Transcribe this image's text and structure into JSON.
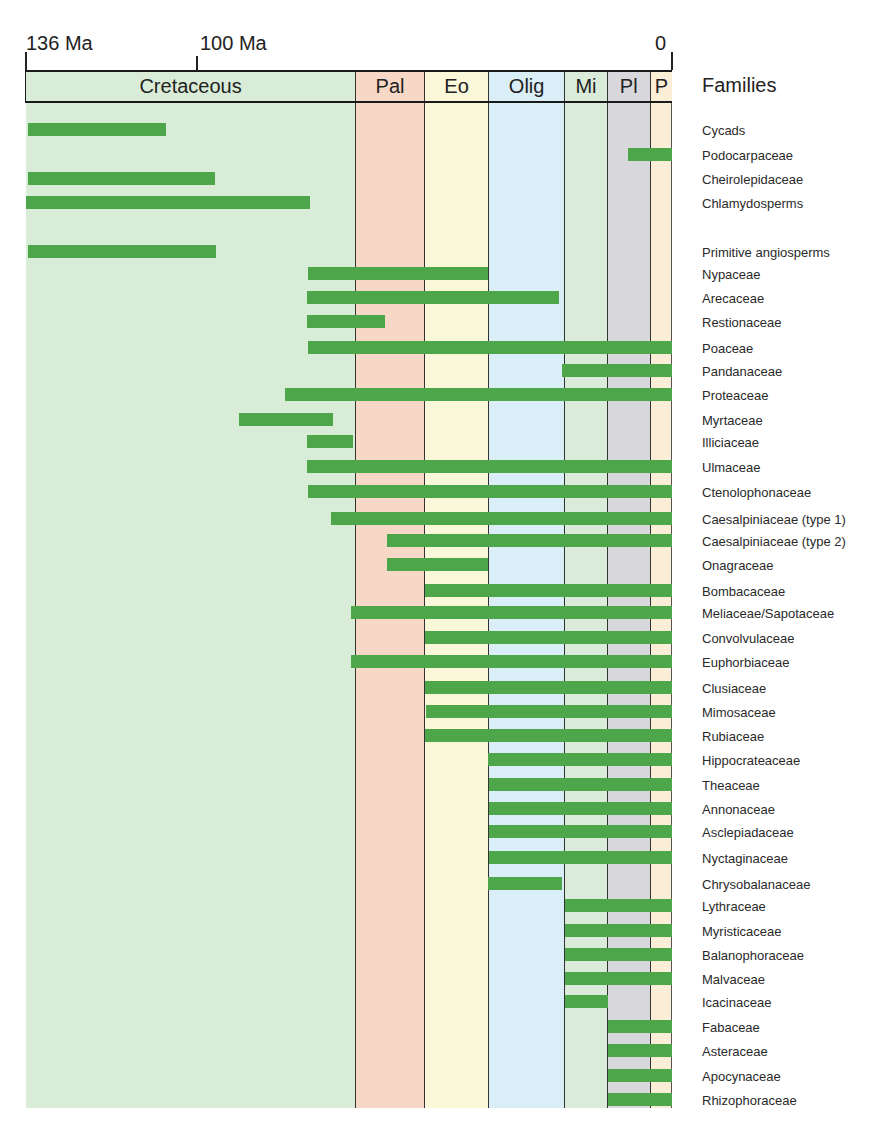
{
  "chart_data": {
    "type": "bar",
    "subtype": "horizontal range (time-range) bars",
    "title": "",
    "xlabel": "Time (Ma)",
    "ylabel": "Families",
    "x_axis": {
      "range_ma": [
        136,
        0
      ],
      "ticks": [
        {
          "label": "136 Ma",
          "value": 136
        },
        {
          "label": "100 Ma",
          "value": 100
        },
        {
          "label": "0",
          "value": 0
        }
      ]
    },
    "periods": [
      {
        "label": "Cretaceous",
        "start_ma": 136,
        "end_ma": 66.5,
        "color": "#d9ecd8"
      },
      {
        "label": "Pal",
        "start_ma": 66.5,
        "end_ma": 52,
        "color": "#f7d7c6"
      },
      {
        "label": "Eo",
        "start_ma": 52,
        "end_ma": 38.5,
        "color": "#fbf8da"
      },
      {
        "label": "Olig",
        "start_ma": 38.5,
        "end_ma": 22.5,
        "color": "#daeef7"
      },
      {
        "label": "Mi",
        "start_ma": 22.5,
        "end_ma": 13.5,
        "color": "#dbebd9"
      },
      {
        "label": "Pl",
        "start_ma": 13.5,
        "end_ma": 4.5,
        "color": "#d7d7dc"
      },
      {
        "label": "P",
        "start_ma": 4.5,
        "end_ma": 0,
        "color": "#fbeed6"
      }
    ],
    "legend_title": "Families",
    "bar_color": "#4ea64a",
    "series": [
      {
        "name": "Cycads",
        "start_ma": 135.6,
        "end_ma": 106.5
      },
      {
        "name": "Podocarpaceae",
        "start_ma": 9.3,
        "end_ma": 0
      },
      {
        "name": "Cheirolepidaceae",
        "start_ma": 135.6,
        "end_ma": 96.3
      },
      {
        "name": "Chlamydosperms",
        "start_ma": 136,
        "end_ma": 76.2
      },
      {
        "name": "Primitive angiosperms",
        "start_ma": 135.6,
        "end_ma": 96.1
      },
      {
        "name": "Nypaceae",
        "start_ma": 76.6,
        "end_ma": 38.7
      },
      {
        "name": "Arecaceae",
        "start_ma": 76.8,
        "end_ma": 23.7
      },
      {
        "name": "Restionaceae",
        "start_ma": 76.8,
        "end_ma": 60.4
      },
      {
        "name": "Poaceae",
        "start_ma": 76.6,
        "end_ma": 0
      },
      {
        "name": "Pandanaceae",
        "start_ma": 23.2,
        "end_ma": 0
      },
      {
        "name": "Proteaceae",
        "start_ma": 81.5,
        "end_ma": 0
      },
      {
        "name": "Myrtaceae",
        "start_ma": 91.2,
        "end_ma": 71.4
      },
      {
        "name": "Illiciaceae",
        "start_ma": 76.8,
        "end_ma": 67.2
      },
      {
        "name": "Ulmaceae",
        "start_ma": 76.8,
        "end_ma": 0
      },
      {
        "name": "Ctenolophonaceae",
        "start_ma": 76.6,
        "end_ma": 0
      },
      {
        "name": "Caesalpiniaceae (type 1)",
        "start_ma": 71.8,
        "end_ma": 0
      },
      {
        "name": "Caesalpiniaceae (type 2)",
        "start_ma": 60.0,
        "end_ma": 0
      },
      {
        "name": "Onagraceae",
        "start_ma": 60.0,
        "end_ma": 38.7
      },
      {
        "name": "Bombacaceae",
        "start_ma": 52.0,
        "end_ma": 0
      },
      {
        "name": "Meliaceae/Sapotaceae",
        "start_ma": 67.6,
        "end_ma": 0
      },
      {
        "name": "Convolvulaceae",
        "start_ma": 52.0,
        "end_ma": 0
      },
      {
        "name": "Euphorbiaceae",
        "start_ma": 67.6,
        "end_ma": 0
      },
      {
        "name": "Clusiaceae",
        "start_ma": 52.0,
        "end_ma": 0
      },
      {
        "name": "Mimosaceae",
        "start_ma": 51.8,
        "end_ma": 0
      },
      {
        "name": "Rubiaceae",
        "start_ma": 52.0,
        "end_ma": 0
      },
      {
        "name": "Hippocrateaceae",
        "start_ma": 38.7,
        "end_ma": 0
      },
      {
        "name": "Theaceae",
        "start_ma": 38.5,
        "end_ma": 0
      },
      {
        "name": "Annonaceae",
        "start_ma": 38.5,
        "end_ma": 0
      },
      {
        "name": "Asclepiadaceae",
        "start_ma": 38.5,
        "end_ma": 0
      },
      {
        "name": "Nyctaginaceae",
        "start_ma": 38.5,
        "end_ma": 0
      },
      {
        "name": "Chrysobalanaceae",
        "start_ma": 38.7,
        "end_ma": 23.2
      },
      {
        "name": "Lythraceae",
        "start_ma": 22.5,
        "end_ma": 0
      },
      {
        "name": "Myristicaceae",
        "start_ma": 22.5,
        "end_ma": 0
      },
      {
        "name": "Balanophoraceae",
        "start_ma": 22.5,
        "end_ma": 0
      },
      {
        "name": "Malvaceae",
        "start_ma": 22.5,
        "end_ma": 0
      },
      {
        "name": "Icacinaceae",
        "start_ma": 22.5,
        "end_ma": 13.5
      },
      {
        "name": "Fabaceae",
        "start_ma": 13.5,
        "end_ma": 0
      },
      {
        "name": "Asteraceae",
        "start_ma": 13.5,
        "end_ma": 0
      },
      {
        "name": "Apocynaceae",
        "start_ma": 13.5,
        "end_ma": 0
      },
      {
        "name": "Rhizophoraceae",
        "start_ma": 13.5,
        "end_ma": 0
      }
    ]
  },
  "header": {
    "tick_136": "136 Ma",
    "tick_100": "100 Ma",
    "tick_0": "0",
    "families_title": "Families"
  },
  "rows_y": [
    130,
    155,
    179,
    203,
    252,
    274,
    298,
    322,
    348,
    371,
    395,
    420,
    442,
    467,
    492,
    519,
    541,
    565,
    591,
    613,
    638,
    662,
    688,
    712,
    736,
    760,
    785,
    809,
    832,
    858,
    884,
    906,
    931,
    955,
    979,
    1002,
    1027,
    1051,
    1076,
    1100
  ]
}
